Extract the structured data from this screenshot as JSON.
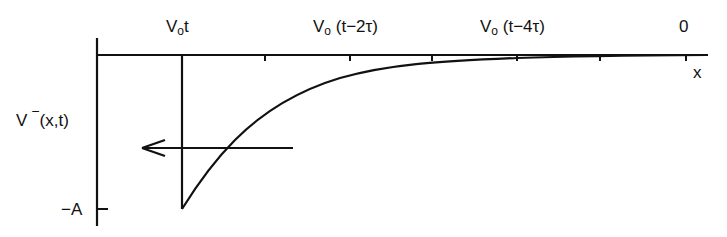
{
  "diagram": {
    "title": "",
    "y_axis_label": {
      "base": "V",
      "superscript": "−",
      "args": "(x,t)"
    },
    "y_tick_label": "−A",
    "x_axis_label": "x",
    "top_labels": [
      {
        "v": "V",
        "sub": "o",
        "rest": "t"
      },
      {
        "v": "V",
        "sub": "o",
        "rest": " (t−2τ)"
      },
      {
        "v": "V",
        "sub": "o",
        "rest": " (t−4τ)"
      },
      {
        "v": "",
        "sub": "",
        "rest": "0"
      }
    ],
    "arrow_direction": "left",
    "curve": "exponential decay from −A at x=V₀t rising toward 0",
    "colors": {
      "line": "#111111",
      "background": "#ffffff"
    }
  }
}
